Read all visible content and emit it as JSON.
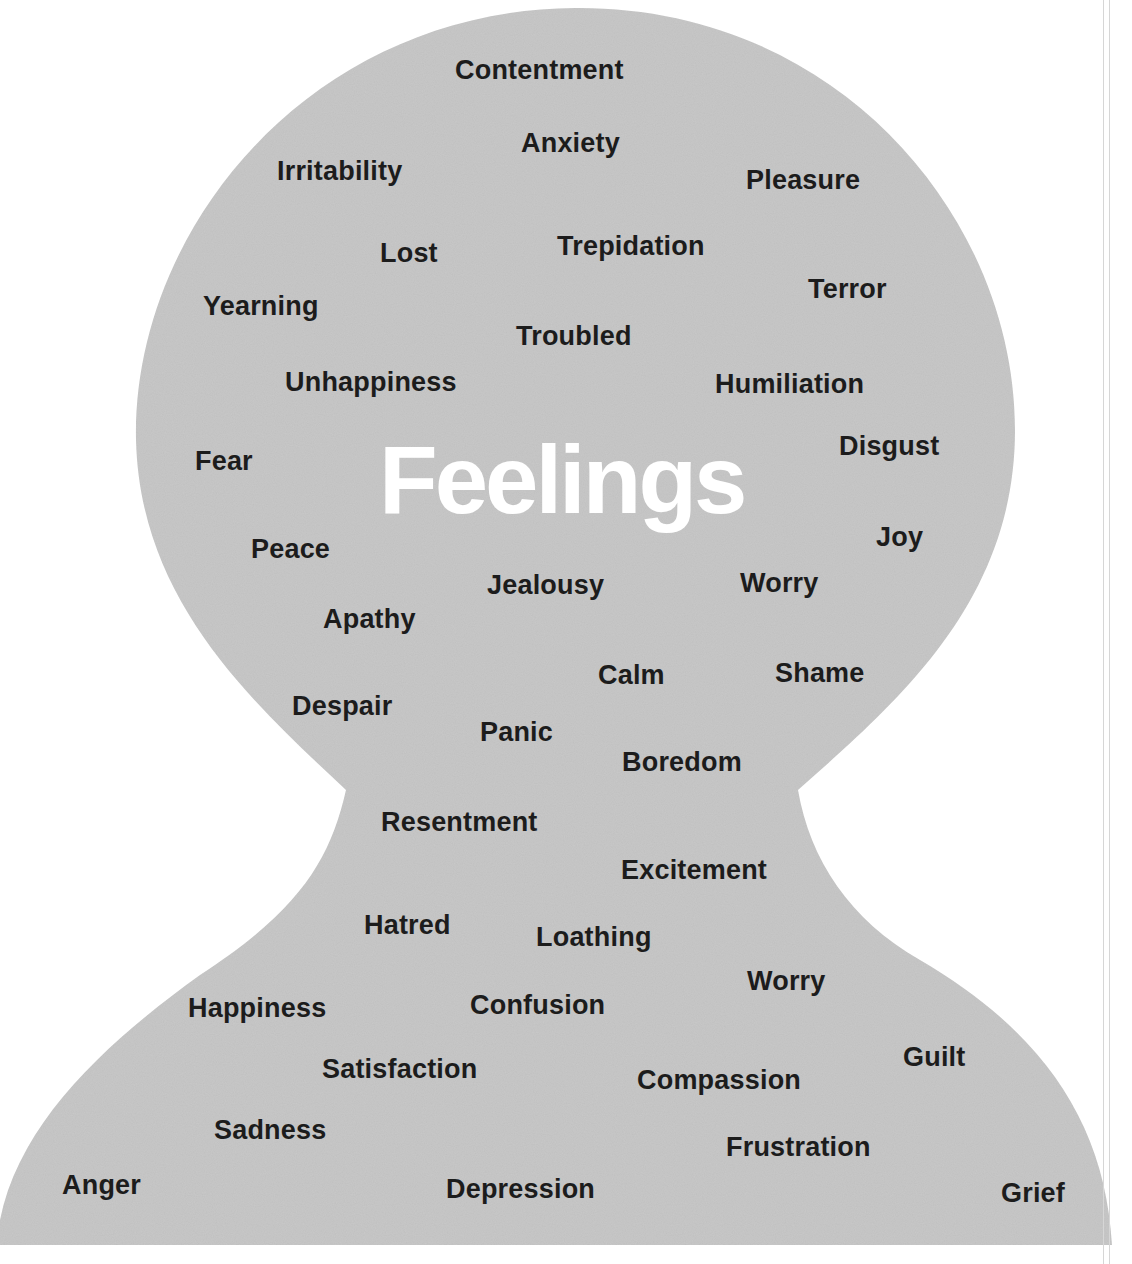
{
  "title": "Feelings",
  "colors": {
    "background": "#ffffff",
    "silhouette_fill": "#c9c9c9",
    "word_text": "#1c1c1c",
    "title_text": "#ffffff"
  },
  "words": [
    {
      "label": "Contentment",
      "x": 455,
      "y": 57
    },
    {
      "label": "Anxiety",
      "x": 521,
      "y": 130
    },
    {
      "label": "Irritability",
      "x": 277,
      "y": 158
    },
    {
      "label": "Pleasure",
      "x": 746,
      "y": 167
    },
    {
      "label": "Lost",
      "x": 380,
      "y": 240
    },
    {
      "label": "Trepidation",
      "x": 557,
      "y": 233
    },
    {
      "label": "Terror",
      "x": 808,
      "y": 276
    },
    {
      "label": "Yearning",
      "x": 203,
      "y": 293
    },
    {
      "label": "Troubled",
      "x": 516,
      "y": 323
    },
    {
      "label": "Unhappiness",
      "x": 285,
      "y": 369
    },
    {
      "label": "Humiliation",
      "x": 715,
      "y": 371
    },
    {
      "label": "Disgust",
      "x": 839,
      "y": 433
    },
    {
      "label": "Fear",
      "x": 195,
      "y": 448
    },
    {
      "label": "Joy",
      "x": 876,
      "y": 524
    },
    {
      "label": "Peace",
      "x": 251,
      "y": 536
    },
    {
      "label": "Jealousy",
      "x": 487,
      "y": 572
    },
    {
      "label": "Worry",
      "x": 740,
      "y": 570
    },
    {
      "label": "Apathy",
      "x": 323,
      "y": 606
    },
    {
      "label": "Calm",
      "x": 598,
      "y": 662
    },
    {
      "label": "Shame",
      "x": 775,
      "y": 660
    },
    {
      "label": "Despair",
      "x": 292,
      "y": 693
    },
    {
      "label": "Panic",
      "x": 480,
      "y": 719
    },
    {
      "label": "Boredom",
      "x": 622,
      "y": 749
    },
    {
      "label": "Resentment",
      "x": 381,
      "y": 809
    },
    {
      "label": "Excitement",
      "x": 621,
      "y": 857
    },
    {
      "label": "Hatred",
      "x": 364,
      "y": 912
    },
    {
      "label": "Loathing",
      "x": 536,
      "y": 924
    },
    {
      "label": "Worry",
      "x": 747,
      "y": 968
    },
    {
      "label": "Happiness",
      "x": 188,
      "y": 995
    },
    {
      "label": "Confusion",
      "x": 470,
      "y": 992
    },
    {
      "label": "Guilt",
      "x": 903,
      "y": 1044
    },
    {
      "label": "Satisfaction",
      "x": 322,
      "y": 1056
    },
    {
      "label": "Compassion",
      "x": 637,
      "y": 1067
    },
    {
      "label": "Sadness",
      "x": 214,
      "y": 1117
    },
    {
      "label": "Frustration",
      "x": 726,
      "y": 1134
    },
    {
      "label": "Anger",
      "x": 62,
      "y": 1172
    },
    {
      "label": "Depression",
      "x": 446,
      "y": 1176
    },
    {
      "label": "Grief",
      "x": 1001,
      "y": 1180
    }
  ]
}
